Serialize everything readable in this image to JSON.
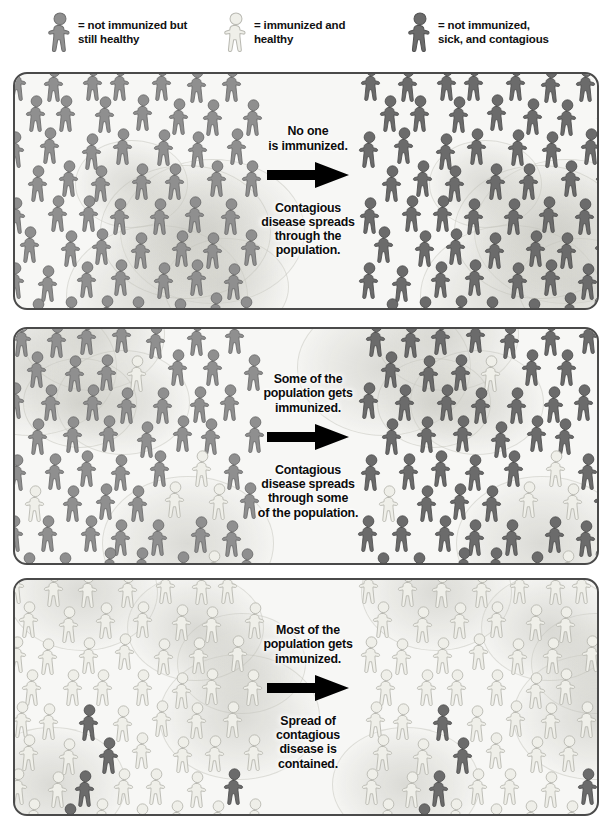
{
  "colors": {
    "unimmunized_healthy": "#8f8f8f",
    "unimmunized_healthy_stroke": "#6f6f6f",
    "immunized_healthy": "#efefe9",
    "immunized_healthy_stroke": "#b9b9b2",
    "sick_contagious": "#6b6b6b",
    "sick_contagious_stroke": "#535353",
    "panel_background": "#f7f7f5",
    "panel_border": "#4a4a4a",
    "arrow": "#000000",
    "text": "#0b0b0b",
    "halo": "#dcdcd6"
  },
  "legend": {
    "items": [
      {
        "id": "legend-unimmunized-healthy",
        "icon": "person-figure-gray-icon",
        "swatch": "unimmunized_healthy",
        "label": "= not immunized but\nstill healthy",
        "x": 46,
        "y": 12
      },
      {
        "id": "legend-immunized-healthy",
        "icon": "person-figure-light-icon",
        "swatch": "immunized_healthy",
        "label": "= immunized and\nhealthy",
        "x": 222,
        "y": 12
      },
      {
        "id": "legend-sick-contagious",
        "icon": "person-figure-dark-icon",
        "swatch": "sick_contagious",
        "label": "= not immunized,\nsick, and contagious",
        "x": 406,
        "y": 12
      }
    ]
  },
  "panels": [
    {
      "id": "panel-no-immunization",
      "name": "no-immunization",
      "top": 72,
      "height": 238,
      "cause_text": "No one\nis immunized.",
      "effect_text": "Contagious\ndisease spreads\nthrough the\npopulation.",
      "arrow_icon": "right-arrow-icon",
      "before": {
        "label": "population before outbreak",
        "immunized_pct": 0,
        "sick_pct": 0,
        "healthy_unimmunized_pct": 100
      },
      "after": {
        "label": "population after outbreak",
        "immunized_pct": 0,
        "sick_pct": 100,
        "healthy_unimmunized_pct": 0
      }
    },
    {
      "id": "panel-some-immunization",
      "name": "some-immunization",
      "top": 327,
      "height": 238,
      "cause_text": "Some of the\npopulation gets\nimmunized.",
      "effect_text": "Contagious\ndisease spreads\nthrough some\nof the population.",
      "arrow_icon": "right-arrow-icon",
      "before": {
        "label": "population before outbreak",
        "immunized_pct": 10,
        "sick_pct": 0,
        "healthy_unimmunized_pct": 90
      },
      "after": {
        "label": "population after outbreak",
        "immunized_pct": 10,
        "sick_pct": 90,
        "healthy_unimmunized_pct": 0
      }
    },
    {
      "id": "panel-most-immunization",
      "name": "most-immunization",
      "top": 578,
      "height": 238,
      "cause_text": "Most of the\npopulation gets\nimmunized.",
      "effect_text": "Spread of\ncontagious\ndisease is\ncontained.",
      "arrow_icon": "right-arrow-icon",
      "before": {
        "label": "population before outbreak",
        "immunized_pct": 92,
        "sick_pct": 8,
        "healthy_unimmunized_pct": 0
      },
      "after": {
        "label": "population after outbreak",
        "immunized_pct": 92,
        "sick_pct": 8,
        "healthy_unimmunized_pct": 0
      }
    }
  ],
  "chart_data": {
    "type": "pictogram",
    "categories": [
      "No one is immunized",
      "Some of the population gets immunized",
      "Most of the population gets immunized"
    ],
    "series": [
      {
        "name": "Immunized and healthy (before)",
        "values": [
          0,
          10,
          92
        ]
      },
      {
        "name": "Not immunized but still healthy (before)",
        "values": [
          100,
          90,
          0
        ]
      },
      {
        "name": "Not immunized, sick, and contagious (before)",
        "values": [
          0,
          0,
          8
        ]
      },
      {
        "name": "Immunized and healthy (after)",
        "values": [
          0,
          10,
          92
        ]
      },
      {
        "name": "Not immunized but still healthy (after)",
        "values": [
          0,
          0,
          0
        ]
      },
      {
        "name": "Not immunized, sick, and contagious (after)",
        "values": [
          100,
          90,
          8
        ]
      }
    ],
    "unit": "percent of population",
    "legend_position": "top",
    "grid": false,
    "note": "Each panel shows the same population before (left) and after (right) exposure to a contagious disease."
  }
}
